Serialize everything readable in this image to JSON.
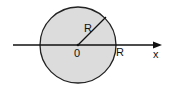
{
  "diagram": {
    "title": "",
    "circle": {
      "fill": "#dcdcdc",
      "stroke": "#222222",
      "cx": 78,
      "cy": 45,
      "r": 38
    },
    "radius_label": "R",
    "origin_label": "0",
    "axis_intercept_label": "R",
    "axis_label": "x",
    "line_color": "#111111"
  }
}
